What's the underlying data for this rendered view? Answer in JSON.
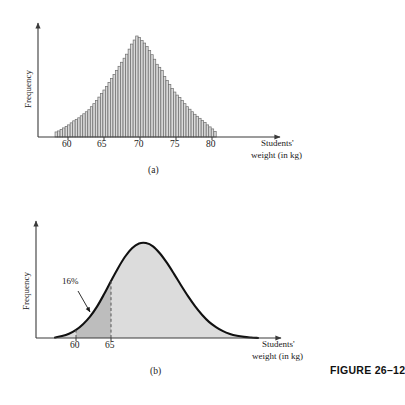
{
  "figure": {
    "caption": "FIGURE 26–12",
    "panel_a_label": "(a)",
    "panel_b_label": "(b)"
  },
  "colors": {
    "axis": "#3a3a3a",
    "bar_fill": "#d9d9d9",
    "bar_stroke": "#6e6e6e",
    "curve": "#111111",
    "area_light": "#dcdcdc",
    "area_dark": "#bdbdbd",
    "dashed": "#555555",
    "text": "#1a1a1a"
  },
  "panel_a": {
    "name": "histogram",
    "ylabel": "Frequency",
    "xlabel_line1": "Students'",
    "xlabel_line2": "weight (in kg)",
    "xticks": [
      "60",
      "65",
      "70",
      "75",
      "80"
    ]
  },
  "panel_b": {
    "name": "normal-curve",
    "ylabel": "Frequency",
    "xlabel_line1": "Students'",
    "xlabel_line2": "weight (in kg)",
    "xticks": [
      "60",
      "65"
    ],
    "annotation": "16%"
  },
  "chart_data": [
    {
      "type": "bar",
      "id": "panel-a-histogram",
      "title": "(a)",
      "xlabel": "Students' weight (in kg)",
      "ylabel": "Frequency",
      "xticks": [
        60,
        65,
        70,
        75,
        80
      ],
      "xlim": [
        58.2,
        81.0
      ],
      "ylim": [
        0,
        1.0
      ],
      "grid": false,
      "legend": "none",
      "note": "Bell-shaped frequency histogram of students' weights; ~64 narrow bars, mode near 70 kg.",
      "categories": [
        58.2,
        58.55,
        58.9,
        59.25,
        59.6,
        59.95,
        60.3,
        60.65,
        61.0,
        61.35,
        61.7,
        62.05,
        62.4,
        62.75,
        63.1,
        63.45,
        63.8,
        64.15,
        64.5,
        64.85,
        65.2,
        65.55,
        65.9,
        66.25,
        66.6,
        66.95,
        67.3,
        67.65,
        68.0,
        68.35,
        68.7,
        69.05,
        69.4,
        69.75,
        70.1,
        70.45,
        70.8,
        71.15,
        71.5,
        71.85,
        72.2,
        72.55,
        72.9,
        73.25,
        73.6,
        73.95,
        74.3,
        74.65,
        75.0,
        75.35,
        75.7,
        76.05,
        76.4,
        76.75,
        77.1,
        77.45,
        77.8,
        78.15,
        78.5,
        78.85,
        79.2,
        79.55,
        79.9,
        80.25
      ],
      "values": [
        0.05,
        0.06,
        0.075,
        0.09,
        0.105,
        0.12,
        0.14,
        0.16,
        0.175,
        0.19,
        0.21,
        0.23,
        0.25,
        0.27,
        0.3,
        0.33,
        0.36,
        0.395,
        0.43,
        0.465,
        0.5,
        0.54,
        0.58,
        0.62,
        0.66,
        0.7,
        0.74,
        0.78,
        0.82,
        0.87,
        0.92,
        0.96,
        1.0,
        0.985,
        0.955,
        0.93,
        0.895,
        0.855,
        0.815,
        0.77,
        0.72,
        0.69,
        0.66,
        0.6,
        0.56,
        0.52,
        0.48,
        0.445,
        0.415,
        0.39,
        0.36,
        0.33,
        0.3,
        0.275,
        0.25,
        0.225,
        0.205,
        0.185,
        0.165,
        0.145,
        0.12,
        0.1,
        0.08,
        0.055
      ]
    },
    {
      "type": "area",
      "id": "panel-b-normal-curve",
      "title": "(b)",
      "xlabel": "Students' weight (in kg)",
      "ylabel": "Frequency",
      "xticks": [
        60,
        65
      ],
      "xlim": [
        57.0,
        86.0
      ],
      "ylim": [
        0,
        1.0
      ],
      "grid": false,
      "legend": "none",
      "annotation_label": "16%",
      "annotation_region": [
        57.0,
        65.0
      ],
      "note": "Smooth normal distribution curve; shaded region left of 65 kg labelled 16%; darker band between 60 and 65.",
      "x": [
        57.0,
        58.0,
        59.0,
        60.0,
        61.0,
        62.0,
        63.0,
        64.0,
        65.0,
        66.0,
        67.0,
        68.0,
        69.0,
        70.0,
        71.0,
        72.0,
        73.0,
        74.0,
        75.0,
        76.0,
        77.0,
        78.0,
        79.0,
        80.0,
        81.0,
        82.0,
        83.0,
        84.0,
        85.0,
        86.0
      ],
      "y": [
        0.005,
        0.02,
        0.045,
        0.085,
        0.145,
        0.225,
        0.33,
        0.46,
        0.6,
        0.735,
        0.855,
        0.945,
        0.995,
        1.0,
        0.965,
        0.89,
        0.79,
        0.675,
        0.555,
        0.44,
        0.335,
        0.245,
        0.17,
        0.115,
        0.072,
        0.043,
        0.024,
        0.012,
        0.005,
        0.0
      ]
    }
  ]
}
